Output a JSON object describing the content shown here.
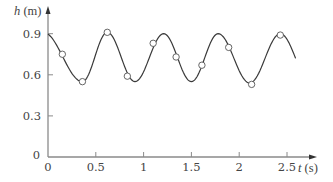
{
  "chart_data": {
    "type": "line",
    "title": "",
    "xlabel": "t (s)",
    "ylabel": "h (m)",
    "xlim": [
      0,
      2.7
    ],
    "ylim": [
      0,
      1.0
    ],
    "x_ticks": [
      0,
      0.5,
      1,
      1.5,
      2,
      2.5
    ],
    "x_tick_labels": [
      "0",
      "0.5",
      "1",
      "1.5",
      "2",
      "2.5"
    ],
    "y_ticks": [
      0,
      0.3,
      0.6,
      0.9
    ],
    "y_tick_labels": [
      "0",
      "0.3",
      "0.6",
      "0.9"
    ],
    "grid": false,
    "legend": null,
    "series": [
      {
        "name": "fitted curve",
        "style": "solid line",
        "description": "sinusoid with period about 0.6 s, oscillating between about 0.54 and 0.91",
        "extrema": [
          {
            "t": 0.0,
            "h": 0.9,
            "kind": "start"
          },
          {
            "t": 0.36,
            "h": 0.55,
            "kind": "min"
          },
          {
            "t": 0.62,
            "h": 0.91,
            "kind": "max"
          },
          {
            "t": 0.91,
            "h": 0.55,
            "kind": "min"
          },
          {
            "t": 1.21,
            "h": 0.9,
            "kind": "max"
          },
          {
            "t": 1.5,
            "h": 0.55,
            "kind": "min"
          },
          {
            "t": 1.78,
            "h": 0.9,
            "kind": "max"
          },
          {
            "t": 2.11,
            "h": 0.54,
            "kind": "min"
          },
          {
            "t": 2.43,
            "h": 0.9,
            "kind": "max"
          },
          {
            "t": 2.59,
            "h": 0.62,
            "kind": "end"
          }
        ]
      },
      {
        "name": "measured data",
        "style": "open circles",
        "points": [
          {
            "t": 0.15,
            "h": 0.75
          },
          {
            "t": 0.36,
            "h": 0.55
          },
          {
            "t": 0.62,
            "h": 0.91
          },
          {
            "t": 0.83,
            "h": 0.59
          },
          {
            "t": 1.1,
            "h": 0.83
          },
          {
            "t": 1.34,
            "h": 0.73
          },
          {
            "t": 1.61,
            "h": 0.67
          },
          {
            "t": 1.89,
            "h": 0.8
          },
          {
            "t": 2.13,
            "h": 0.53
          },
          {
            "t": 2.43,
            "h": 0.89
          }
        ]
      }
    ]
  },
  "labels": {
    "y_axis_var": "h",
    "y_axis_unit": " (m)",
    "x_axis_var": "t",
    "x_axis_unit": " (s)"
  },
  "colors": {
    "axis": "#8a8a8a",
    "curve": "#3a3a3a",
    "marker_fill": "#ffffff",
    "marker_stroke": "#555555",
    "text": "#444444"
  }
}
